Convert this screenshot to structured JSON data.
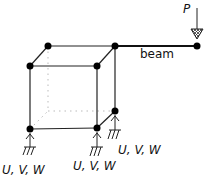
{
  "diagram": {
    "type": "structural frame with cantilever beam",
    "load_label": "P",
    "beam_label": "beam",
    "supports": [
      {
        "label": "U, V, W",
        "position": "front-left"
      },
      {
        "label": "U, V, W",
        "position": "front-right"
      },
      {
        "label": "U, V, W",
        "position": "back-right"
      }
    ],
    "colors": {
      "line": "#111111",
      "node": "#000000",
      "hidden": "#bbbbbb"
    }
  }
}
